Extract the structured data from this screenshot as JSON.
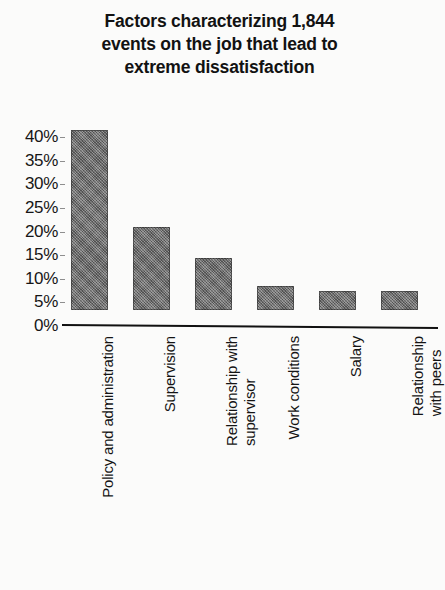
{
  "chart_data": {
    "type": "bar",
    "title": "Factors characterizing 1,844\nevents on the job that lead to\nextreme dissatisfaction",
    "xlabel": "",
    "ylabel": "",
    "ylim": [
      0,
      40
    ],
    "grid": false,
    "legend": "none",
    "bar_color": "#6e6e6e",
    "axis_color": "#111111",
    "categories": [
      "Policy and administration",
      "Supervision",
      "Relationship with\nsupervisor",
      "Work conditions",
      "Salary",
      "Relationship with peers"
    ],
    "values": [
      38,
      17.5,
      11,
      5,
      4,
      4
    ],
    "value_unit": "%",
    "y_ticks": [
      0,
      5,
      10,
      15,
      20,
      25,
      30,
      35,
      40
    ],
    "y_tick_labels": [
      "0%",
      "5%",
      "10%",
      "15%",
      "20%",
      "25%",
      "30%",
      "35%",
      "40%"
    ]
  }
}
